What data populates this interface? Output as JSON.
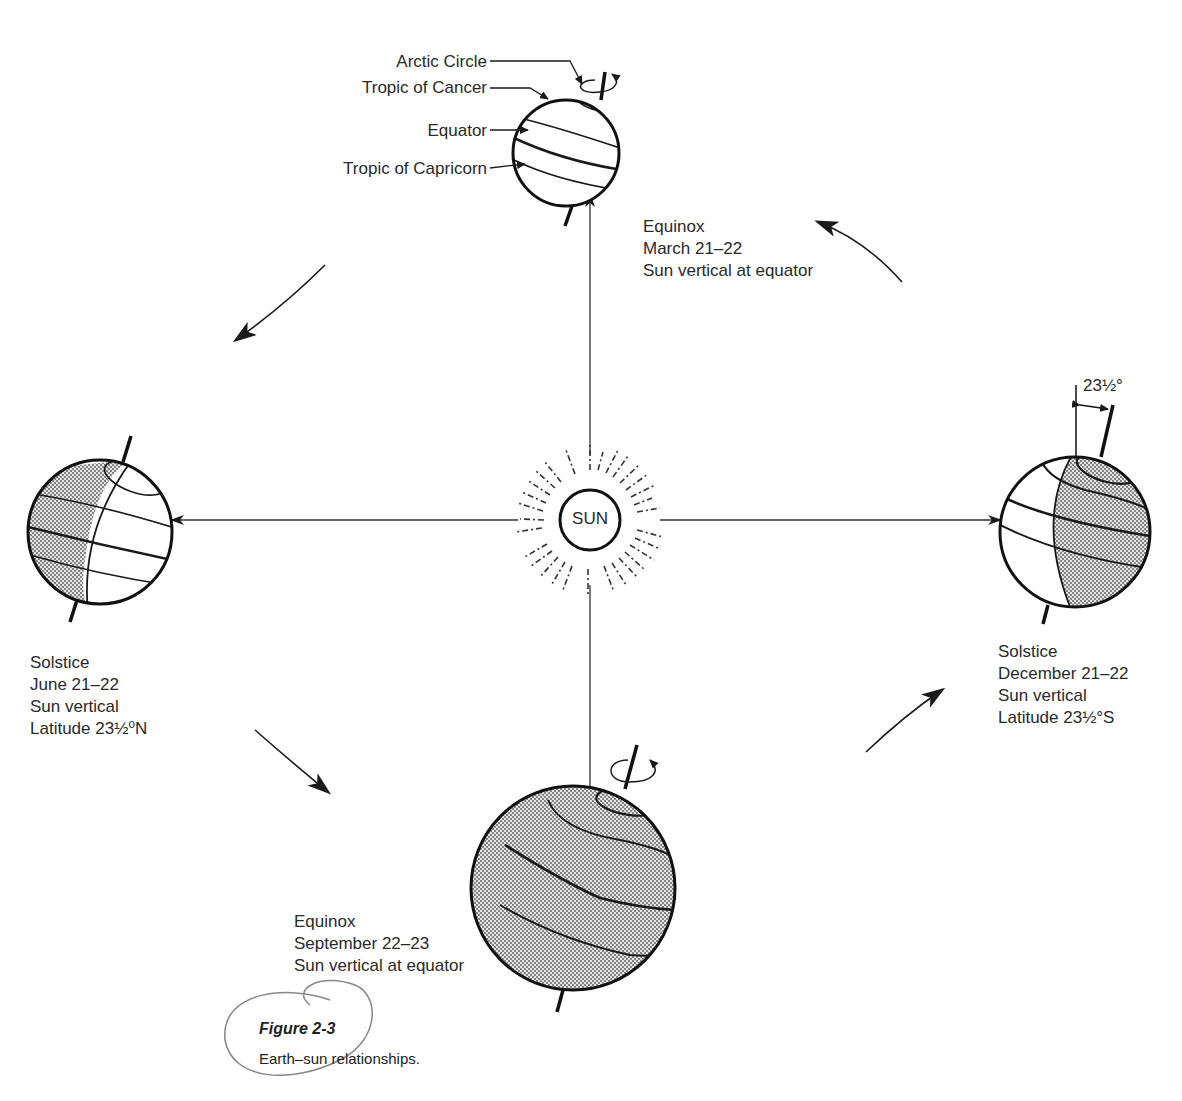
{
  "figure": {
    "title": "Figure 2-3",
    "caption": "Earth–sun relationships."
  },
  "sun": {
    "label": "SUN"
  },
  "globe_labels": {
    "arctic_circle": "Arctic Circle",
    "tropic_of_cancer": "Tropic of Cancer",
    "equator": "Equator",
    "tropic_of_capricorn": "Tropic of Capricorn"
  },
  "positions": {
    "march": {
      "lines": [
        "Equinox",
        "March 21–22",
        "Sun vertical at equator"
      ]
    },
    "june": {
      "lines": [
        "Solstice",
        "June 21–22",
        "Sun vertical",
        "Latitude 23½⁰N"
      ]
    },
    "september": {
      "lines": [
        "Equinox",
        "September 22–23",
        "Sun vertical at equator"
      ]
    },
    "december": {
      "lines": [
        "Solstice",
        "December 21–22",
        "Sun vertical",
        "Latitude 23½°S"
      ]
    }
  },
  "axial_tilt_label": "23½°",
  "colors": {
    "ink": "#1a1a1a",
    "shade": "#b8b8b8",
    "caption_loop": "#888888"
  }
}
